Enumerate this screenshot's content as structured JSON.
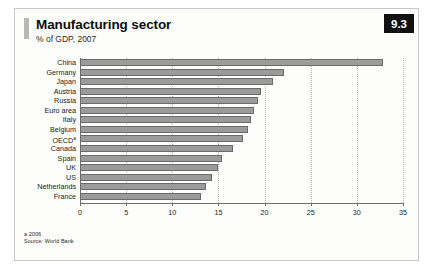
{
  "figure": {
    "page_badge": "9.3",
    "title": "Manufacturing sector",
    "subtitle": "% of GDP, 2007",
    "footnote_a": "a 2006",
    "source": "Source: World Bank",
    "bar_color": "#9b9b9b",
    "bar_border_color": "#6b6b6b",
    "axis_color": "#6e6e6e",
    "grid_color": "#b5b5b0",
    "badge_bg": "#111111",
    "badge_fg": "#ffffff",
    "frame_border": "#c9c9c4",
    "background": "#fdfdfc"
  },
  "chart_data": {
    "type": "bar",
    "orientation": "horizontal",
    "title": "Manufacturing sector",
    "subtitle": "% of GDP, 2007",
    "xlabel": "",
    "ylabel": "",
    "xlim": [
      0,
      35
    ],
    "ticks": [
      0,
      5,
      10,
      15,
      20,
      25,
      30,
      35
    ],
    "grid": true,
    "grid_axis": "x",
    "legend": false,
    "source": "Source: World Bank",
    "notes": [
      "a 2006"
    ],
    "categories": [
      "China",
      "Germany",
      "Japan",
      "Austria",
      "Russia",
      "Euro area",
      "Italy",
      "Belgium",
      "OECD",
      "Canada",
      "Spain",
      "UK",
      "US",
      "Netherlands",
      "France"
    ],
    "category_notes": {
      "OECD": "a"
    },
    "values": [
      32.8,
      22.1,
      20.9,
      19.6,
      19.3,
      18.9,
      18.5,
      18.2,
      17.7,
      16.6,
      15.4,
      15.0,
      14.3,
      13.7,
      13.1
    ],
    "unit": "% of GDP"
  }
}
